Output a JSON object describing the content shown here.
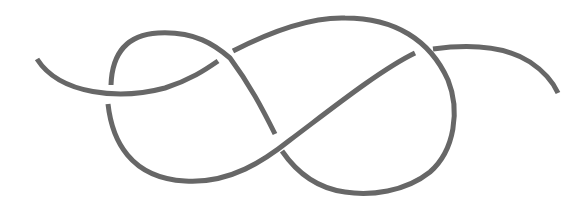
{
  "diagram": {
    "type": "knot-diagram",
    "knot": "figure-eight knot (open strand)",
    "background": "#ffffff",
    "stroke_color": "#676767",
    "stroke_width": 5,
    "crossings": 4,
    "strands": [
      {
        "id": "left-tail",
        "d": "M37,59 C60,95 120,100 165,88 C190,80 205,70 218,61"
      },
      {
        "id": "upper-left-loop",
        "d": "M111,85 C112,55 125,35 158,33 C195,31 215,45 230,58 C250,85 262,108 275,134"
      },
      {
        "id": "lower-center-strand",
        "d": "M108,104 C112,140 130,178 185,181 C230,184 265,160 290,140 C330,110 380,70 415,53"
      },
      {
        "id": "upper-right-loop",
        "d": "M233,51 C270,32 310,17 345,18 C395,18 430,40 448,80 C460,110 455,150 430,172 C405,192 370,196 345,192 C315,188 295,170 282,151"
      },
      {
        "id": "right-tail",
        "d": "M433,49 C470,44 505,46 530,62 C545,72 553,82 558,93"
      }
    ]
  }
}
